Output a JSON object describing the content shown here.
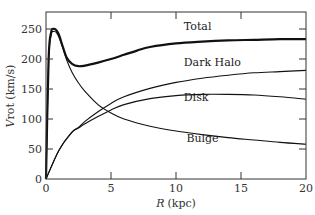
{
  "chart_data": {
    "type": "line",
    "title": "",
    "xlabel": "R (kpc)",
    "xlabel_var": "R",
    "xlabel_unit": "(kpc)",
    "ylabel": "Vrot (km/s)",
    "ylabel_var": "V",
    "ylabel_rest": "rot (km/s)",
    "xlim": [
      0,
      20
    ],
    "ylim": [
      0,
      280
    ],
    "xticks": [
      0,
      5,
      10,
      15,
      20
    ],
    "yticks": [
      0,
      50,
      100,
      150,
      200,
      250
    ],
    "grid": false,
    "legend": "inline labels",
    "series": [
      {
        "name": "Total",
        "label_pos": [
          10.6,
          248
        ],
        "x": [
          0,
          0.2,
          0.4,
          0.6,
          0.8,
          1.0,
          1.3,
          1.6,
          2.0,
          2.5,
          3,
          4,
          5,
          6,
          7,
          8,
          10,
          12,
          14,
          16,
          18,
          20
        ],
        "values": [
          0,
          200,
          245,
          250,
          248,
          240,
          220,
          202,
          192,
          188,
          189,
          194,
          200,
          207,
          214,
          220,
          226,
          229,
          231,
          232,
          233,
          233
        ]
      },
      {
        "name": "Dark Halo",
        "label_pos": [
          10.6,
          188
        ],
        "x": [
          0,
          1,
          2,
          2.5,
          3,
          4,
          5,
          6,
          8,
          10,
          12,
          14,
          16,
          18,
          20
        ],
        "values": [
          0,
          48,
          78,
          86,
          96,
          112,
          126,
          137,
          151,
          161,
          168,
          173,
          177,
          179,
          181
        ]
      },
      {
        "name": "Disk",
        "label_pos": [
          10.6,
          130
        ],
        "x": [
          0,
          1,
          2,
          2.5,
          3,
          4,
          5,
          6,
          8,
          10,
          12,
          14,
          16,
          18,
          20
        ],
        "values": [
          0,
          48,
          78,
          85,
          92,
          104,
          115,
          124,
          134,
          139,
          141,
          141,
          140,
          137,
          133
        ]
      },
      {
        "name": "Bulge",
        "label_pos": [
          10.8,
          62
        ],
        "x": [
          0,
          0.2,
          0.4,
          0.6,
          0.8,
          1.0,
          1.3,
          1.6,
          2.0,
          2.5,
          3,
          4,
          5,
          6,
          8,
          10,
          12,
          14,
          16,
          18,
          20
        ],
        "values": [
          0,
          195,
          240,
          246,
          244,
          236,
          218,
          198,
          178,
          160,
          146,
          124,
          110,
          100,
          88,
          80,
          74,
          69,
          65,
          61,
          58
        ]
      }
    ]
  }
}
